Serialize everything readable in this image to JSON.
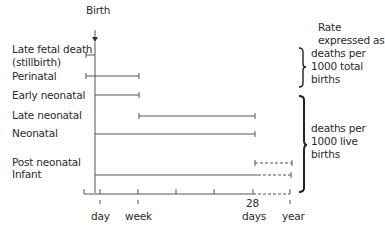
{
  "header": {
    "birth_label": "Birth",
    "rate_title_line1": "Rate",
    "rate_title_line2": "expressed as"
  },
  "rows": [
    {
      "label_line1": "Late fetal death",
      "label_line2": "(stillbirth)",
      "start": "before birth",
      "end": "birth"
    },
    {
      "label_line1": "Perinatal",
      "start": "before birth",
      "end": "week"
    },
    {
      "label_line1": "Early neonatal",
      "start": "birth",
      "end": "week"
    },
    {
      "label_line1": "Late neonatal",
      "start": "week",
      "end": "28 days"
    },
    {
      "label_line1": "Neonatal",
      "start": "birth",
      "end": "28 days"
    },
    {
      "label_line1": "Post neonatal",
      "start": "28 days",
      "end": "year",
      "style": "dashed"
    },
    {
      "label_line1": "Infant",
      "start": "birth",
      "end": "year",
      "style": "solid then dashed"
    }
  ],
  "groups": [
    {
      "line1": "deaths per",
      "line2": "1000 total",
      "line3": "births"
    },
    {
      "line1": "deaths per",
      "line2": "1000 live",
      "line3": "births"
    }
  ],
  "axis": {
    "ticks": [
      "day",
      "week",
      "28",
      "days",
      "year"
    ]
  }
}
